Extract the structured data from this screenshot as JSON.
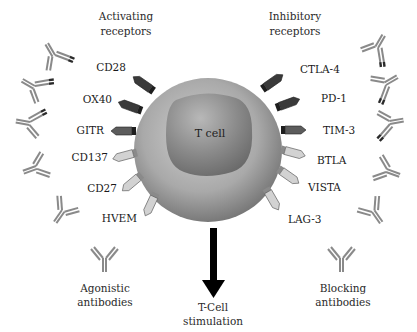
{
  "headings": {
    "activating": [
      "Activating",
      "receptors"
    ],
    "inhibitory": [
      "Inhibitory",
      "receptors"
    ]
  },
  "cell": {
    "label": "T cell"
  },
  "activating_receptors": [
    {
      "label": "CD28",
      "shade": "dark"
    },
    {
      "label": "OX40",
      "shade": "dark"
    },
    {
      "label": "GITR",
      "shade": "medium"
    },
    {
      "label": "CD137",
      "shade": "light"
    },
    {
      "label": "CD27",
      "shade": "light"
    },
    {
      "label": "HVEM",
      "shade": "light"
    }
  ],
  "inhibitory_receptors": [
    {
      "label": "CTLA-4",
      "shade": "dark"
    },
    {
      "label": "PD-1",
      "shade": "dark"
    },
    {
      "label": "TIM-3",
      "shade": "medium"
    },
    {
      "label": "BTLA",
      "shade": "light"
    },
    {
      "label": "VISTA",
      "shade": "light"
    },
    {
      "label": "LAG-3",
      "shade": "light"
    }
  ],
  "antibodies": {
    "agonistic": [
      "Agonistic",
      "antibodies"
    ],
    "blocking": [
      "Blocking",
      "antibodies"
    ]
  },
  "output": {
    "label": [
      "T-Cell",
      "stimulation"
    ]
  },
  "colors": {
    "dark": "#3a3a3a",
    "medium": "#5a5a5a",
    "light": "#c8c8c8",
    "cell_outer": "#a8a8a8",
    "nucleus": "#8e8e8e",
    "antibody": "#8a8a8a"
  }
}
